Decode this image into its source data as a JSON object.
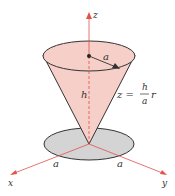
{
  "diagram": {
    "axes": {
      "z": "z",
      "x": "x",
      "y": "y"
    },
    "labels": {
      "radius_top": "a",
      "height": "h",
      "equation_lhs": "z =",
      "equation_num": "h",
      "equation_den": "a",
      "equation_var": "r",
      "base_left": "a",
      "base_right": "a"
    },
    "colors": {
      "cone_fill": "#f6cfc8",
      "axis": "#e0524a",
      "base_fill": "#d4d4d4",
      "outline": "#333333"
    }
  }
}
